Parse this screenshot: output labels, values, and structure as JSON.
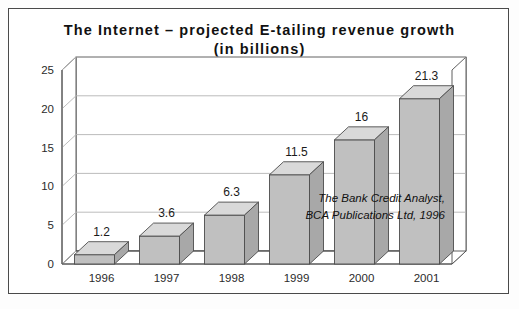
{
  "figure": {
    "title_line1": "The Internet – projected E-tailing revenue growth",
    "title_line2": "(in billions)",
    "title_full": "The Internet – projected E-tailing revenue growth\n(in billions)",
    "border_color": "#4a4a4a",
    "background_color": "#ffffff"
  },
  "annotation": {
    "line1": "The Bank Credit Analyst,",
    "line2": "BCA Publications Ltd, 1996"
  },
  "colors": {
    "bar_front": "#c0c0c0",
    "bar_top": "#d9d9d9",
    "bar_side": "#a8a8a8",
    "bar_outline": "#4d4d4d",
    "grid": "#b4b4b4",
    "axis": "#4d4d4d",
    "text": "#1a1a1a"
  },
  "chart_data": {
    "type": "bar",
    "title": "The Internet – projected E-tailing revenue growth (in billions)",
    "categories": [
      "1996",
      "1997",
      "1998",
      "1999",
      "2000",
      "2001"
    ],
    "values": [
      1.2,
      3.6,
      6.3,
      11.5,
      16,
      21.3
    ],
    "value_labels": [
      "1.2",
      "3.6",
      "6.3",
      "11.5",
      "16",
      "21.3"
    ],
    "xlabel": "",
    "ylabel": "",
    "ylim": [
      0,
      25
    ],
    "yticks": [
      0,
      5,
      10,
      15,
      20,
      25
    ],
    "ytick_labels": [
      "0",
      "5",
      "10",
      "15",
      "20",
      "25"
    ],
    "grid": true,
    "grid_axis": "y",
    "legend": false,
    "three_d": true,
    "annotation": "The Bank Credit Analyst, BCA Publications Ltd, 1996"
  }
}
